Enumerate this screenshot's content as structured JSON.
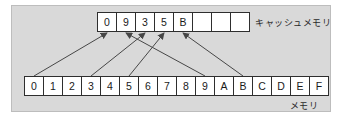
{
  "diagram": {
    "cache": {
      "label": "キャッシュメモリ",
      "cells": [
        "0",
        "9",
        "3",
        "5",
        "B",
        "",
        "",
        ""
      ]
    },
    "memory": {
      "label": "メモリ",
      "cells": [
        "0",
        "1",
        "2",
        "3",
        "4",
        "5",
        "6",
        "7",
        "8",
        "9",
        "A",
        "B",
        "C",
        "D",
        "E",
        "F"
      ]
    },
    "mappings": [
      {
        "value": "0",
        "memory_index": 0,
        "cache_index": 0
      },
      {
        "value": "9",
        "memory_index": 9,
        "cache_index": 1
      },
      {
        "value": "3",
        "memory_index": 3,
        "cache_index": 2
      },
      {
        "value": "5",
        "memory_index": 5,
        "cache_index": 3
      },
      {
        "value": "B",
        "memory_index": 11,
        "cache_index": 4
      }
    ],
    "colors": {
      "panel_bg": "#d9d9d9",
      "panel_border": "#bdbdbd",
      "cell_bg": "#ffffff",
      "cell_border": "#2e2e2e",
      "arrow": "#474747",
      "text": "#1a1a1a"
    }
  }
}
